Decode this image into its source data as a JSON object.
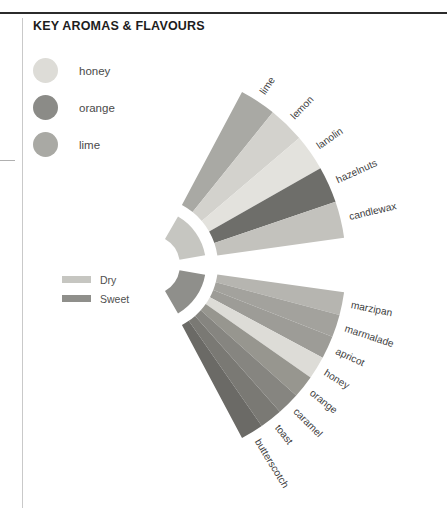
{
  "panel": {
    "title": "KEY AROMAS & FLAVOURS"
  },
  "aroma_key": {
    "items": [
      {
        "label": "honey",
        "color": "#dddcd7"
      },
      {
        "label": "orange",
        "color": "#8b8b87"
      },
      {
        "label": "lime",
        "color": "#a9a9a4"
      }
    ]
  },
  "intensity_key": {
    "items": [
      {
        "label": "Dry",
        "color": "#c6c6c1"
      },
      {
        "label": "Sweet",
        "color": "#8f8f8b"
      }
    ]
  },
  "chart_data": {
    "type": "pie",
    "title": "KEY AROMAS & FLAVOURS",
    "subtype": "split-fan / radial aroma wheel",
    "legend_position": "left",
    "grid": false,
    "pivot": {
      "x": 150,
      "y": 265
    },
    "inner_radius": 30,
    "ring_outer_radius": 56,
    "wedge_inner_radius": 68,
    "wedge_outer_radius": 196,
    "groups": [
      {
        "name": "Dry",
        "color": "#c6c6c1",
        "arc_start_deg": -62,
        "arc_end_deg": -8,
        "segments": [
          {
            "label": "lime",
            "color": "#a9a9a4",
            "value": 1
          },
          {
            "label": "lemon",
            "color": "#d3d2cd",
            "value": 1
          },
          {
            "label": "lanolin",
            "color": "#e3e2dd",
            "value": 1
          },
          {
            "label": "hazelnuts",
            "color": "#6e6e6a",
            "value": 1
          },
          {
            "label": "candlewax",
            "color": "#c3c2bd",
            "value": 1
          }
        ]
      },
      {
        "name": "Sweet",
        "color": "#8f8f8b",
        "arc_start_deg": 8,
        "arc_end_deg": 62,
        "segments": [
          {
            "label": "marzipan",
            "color": "#b6b5b0",
            "value": 1
          },
          {
            "label": "marmalade",
            "color": "#a3a29d",
            "value": 1
          },
          {
            "label": "apricot",
            "color": "#9d9c97",
            "value": 1
          },
          {
            "label": "honey",
            "color": "#dddcd7",
            "value": 1
          },
          {
            "label": "orange",
            "color": "#97968f",
            "value": 1
          },
          {
            "label": "caramel",
            "color": "#868580",
            "value": 1
          },
          {
            "label": "toast",
            "color": "#7a7974",
            "value": 1
          },
          {
            "label": "butterscotch",
            "color": "#6b6a66",
            "value": 1
          }
        ]
      }
    ]
  }
}
